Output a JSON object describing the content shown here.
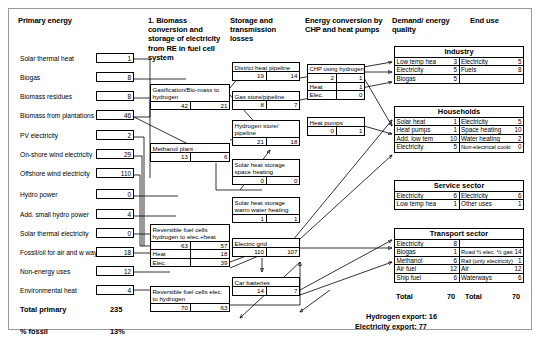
{
  "headers": {
    "primary": "Primary energy",
    "biomass": "1. Biomass conversion and storage of electricity from RE in fuel cell system",
    "storage": "Storage and transmission losses",
    "conversion": "Energy conversion by CHP and heat pumps",
    "demand": "Demand/ energy quality",
    "enduse": "End use"
  },
  "primary": {
    "items": [
      {
        "label": "Solar thermal heat",
        "value": "1"
      },
      {
        "label": "Biogas",
        "value": "8"
      },
      {
        "label": "Biomass residues",
        "value": "8"
      },
      {
        "label": "Biomass from plantations",
        "value": "46"
      },
      {
        "label": "PV electricity",
        "value": "2"
      },
      {
        "label": "On-shore wind electricity",
        "value": "29"
      },
      {
        "label": "Offshore wind electricity",
        "value": "110"
      },
      {
        "label": "Hydro power",
        "value": "0"
      },
      {
        "label": "Add. small hydro power",
        "value": "4"
      },
      {
        "label": "Solar thermal electricity",
        "value": "0"
      },
      {
        "label": "Fossil/oil for air and w ways",
        "value": "18"
      },
      {
        "label": "Non-energy uses",
        "value": "12"
      },
      {
        "label": "Environmental heat",
        "value": "4"
      }
    ],
    "total_label": "Total primary",
    "total_value": "235",
    "fossil_label": "% fossil",
    "fossil_value": "13%"
  },
  "processes": {
    "gasification": {
      "title": "Gasification/Bio-mass to hydrogen",
      "left": "42",
      "right": "21"
    },
    "methanol": {
      "title": "Methanol plant",
      "left": "13",
      "right": "6"
    },
    "rfc_h2_to_elec": {
      "title": "Reversible fuel cells hydrogen to elec.+heat",
      "left": "63",
      "right": "57",
      "rows": [
        {
          "label": "Heat",
          "value": "18"
        },
        {
          "label": "Elec.",
          "value": "39"
        }
      ]
    },
    "rfc_elec_to_h2": {
      "title": "Reversible fuel cells elec. to hydrogen",
      "left": "70",
      "right": "63"
    }
  },
  "storage": {
    "district_heat": {
      "title": "District heat pipeline",
      "left": "19",
      "right": "14"
    },
    "gas_store": {
      "title": "Gas store/pipeline",
      "left": "8",
      "right": "7"
    },
    "hydrogen_store": {
      "title": "Hydrogen store/ pipeline",
      "left": "21",
      "right": "18"
    },
    "solar_space": {
      "title": "Solar heat storage space heating",
      "left": "0",
      "right": "0"
    },
    "solar_water": {
      "title": "Solar heat storage warm water heating",
      "left": "1",
      "right": "1"
    },
    "electric_grid": {
      "title": "Electric grid",
      "left": "110",
      "right": "107"
    },
    "car_batteries": {
      "title": "Car batteries",
      "left": "14",
      "right": "7"
    }
  },
  "conversion": {
    "chp": {
      "title": "CHP using hydrogen",
      "left": "2",
      "right": "1",
      "rows": [
        {
          "label": "Heat",
          "value": "1"
        },
        {
          "label": "Elec.",
          "value": "0"
        }
      ]
    },
    "heat_pumps": {
      "title": "Heat pumps",
      "left": "0",
      "right": "1"
    }
  },
  "sectors": [
    {
      "name": "Industry",
      "demand": [
        {
          "label": "Low temp hea",
          "value": "3"
        },
        {
          "label": "Electricity",
          "value": "5"
        },
        {
          "label": "Biogas",
          "value": "5"
        }
      ],
      "enduse": [
        {
          "label": "Electricity",
          "value": "5"
        },
        {
          "label": "Fuels",
          "value": "8"
        }
      ]
    },
    {
      "name": "Households",
      "demand": [
        {
          "label": "Solar heat",
          "value": "1"
        },
        {
          "label": "Heat pumps",
          "value": "1"
        },
        {
          "label": "Add. low tem",
          "value": "10"
        },
        {
          "label": "Electricity",
          "value": "5"
        }
      ],
      "enduse": [
        {
          "label": "Electricity",
          "value": "5"
        },
        {
          "label": "Space heating",
          "value": "10"
        },
        {
          "label": "Water heating",
          "value": "2"
        },
        {
          "label": "Non-electrical cooki",
          "value": "0"
        }
      ]
    },
    {
      "name": "Service sector",
      "demand": [
        {
          "label": "Electricity",
          "value": "6"
        },
        {
          "label": "Low temp hea",
          "value": "1"
        }
      ],
      "enduse": [
        {
          "label": "Electricity",
          "value": "6"
        },
        {
          "label": "Other uses",
          "value": "1"
        }
      ]
    },
    {
      "name": "Transport sector",
      "demand": [
        {
          "label": "Electricity",
          "value": "8"
        },
        {
          "label": "Biogas",
          "value": "1"
        },
        {
          "label": "Methanol",
          "value": "6"
        },
        {
          "label": "Air fuel",
          "value": "12"
        },
        {
          "label": "Ship fuel",
          "value": "6"
        }
      ],
      "enduse": [
        {
          "label": "Road ½ elec. ½ gas",
          "value": "14"
        },
        {
          "label": "Rail (only electricity)",
          "value": "1"
        },
        {
          "label": "Air",
          "value": "12"
        },
        {
          "label": "Waterways",
          "value": "6"
        }
      ]
    }
  ],
  "bottom": {
    "total_demand_label": "Total",
    "total_demand_value": "70",
    "total_enduse_label": "Total",
    "total_enduse_value": "70",
    "hydrogen_export": "Hydrogen export: 16",
    "electricity_export": "Electricity export:  77"
  }
}
